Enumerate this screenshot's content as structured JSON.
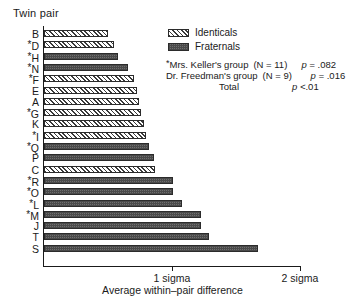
{
  "chart": {
    "y_axis_title": "Twin pair",
    "x_axis_title": "Average within–pair difference",
    "tick_labels": [
      "1 sigma",
      "2 sigma"
    ]
  },
  "legend": {
    "items": [
      {
        "label": "Identicals",
        "pattern": "hatched"
      },
      {
        "label": "Fraternals",
        "pattern": "dotted"
      }
    ]
  },
  "notes": [
    {
      "label": "*Mrs. Keller's group",
      "n": "(N = 11)",
      "p_prefix": "p = ",
      "p_value": ".082"
    },
    {
      "label": "Dr. Freedman's group",
      "n": "(N = 9)",
      "p_prefix": "p = ",
      "p_value": ".016"
    },
    {
      "label": "Total",
      "n": "",
      "p_prefix": "p <",
      "p_value": ".01"
    }
  ],
  "chart_data": {
    "type": "bar",
    "orientation": "horizontal",
    "title": "",
    "xlabel": "Average within–pair difference",
    "ylabel": "Twin pair",
    "xlim": [
      0,
      2
    ],
    "xticks": [
      1,
      2
    ],
    "xticklabels": [
      "1 sigma",
      "2 sigma"
    ],
    "grid": false,
    "legend_position": "upper-right",
    "units": "sigma",
    "starred_note": "* marks Mrs. Keller's group",
    "categories": [
      "B",
      "*D",
      "*H",
      "*N",
      "*F",
      "E",
      "A",
      "*G",
      "K",
      "*I",
      "*Q",
      "P",
      "C",
      "*R",
      "*O",
      "*L",
      "*M",
      "J",
      "T",
      "S"
    ],
    "values": [
      0.5,
      0.55,
      0.58,
      0.66,
      0.7,
      0.73,
      0.74,
      0.76,
      0.78,
      0.8,
      0.82,
      0.86,
      0.87,
      1.01,
      1.01,
      1.08,
      1.23,
      1.23,
      1.29,
      1.67
    ],
    "bars": [
      {
        "label": "B",
        "starred": false,
        "value": 0.5,
        "group": "identicals"
      },
      {
        "label": "D",
        "starred": true,
        "value": 0.55,
        "group": "identicals"
      },
      {
        "label": "H",
        "starred": true,
        "value": 0.58,
        "group": "fraternals"
      },
      {
        "label": "N",
        "starred": true,
        "value": 0.66,
        "group": "fraternals"
      },
      {
        "label": "F",
        "starred": true,
        "value": 0.7,
        "group": "identicals"
      },
      {
        "label": "E",
        "starred": false,
        "value": 0.73,
        "group": "identicals"
      },
      {
        "label": "A",
        "starred": false,
        "value": 0.74,
        "group": "identicals"
      },
      {
        "label": "G",
        "starred": true,
        "value": 0.76,
        "group": "identicals"
      },
      {
        "label": "K",
        "starred": false,
        "value": 0.78,
        "group": "identicals"
      },
      {
        "label": "I",
        "starred": true,
        "value": 0.8,
        "group": "identicals"
      },
      {
        "label": "Q",
        "starred": true,
        "value": 0.82,
        "group": "fraternals"
      },
      {
        "label": "P",
        "starred": false,
        "value": 0.86,
        "group": "fraternals"
      },
      {
        "label": "C",
        "starred": false,
        "value": 0.87,
        "group": "identicals"
      },
      {
        "label": "R",
        "starred": true,
        "value": 1.01,
        "group": "fraternals"
      },
      {
        "label": "O",
        "starred": true,
        "value": 1.01,
        "group": "fraternals"
      },
      {
        "label": "L",
        "starred": true,
        "value": 1.08,
        "group": "fraternals"
      },
      {
        "label": "M",
        "starred": true,
        "value": 1.23,
        "group": "fraternals"
      },
      {
        "label": "J",
        "starred": false,
        "value": 1.23,
        "group": "fraternals"
      },
      {
        "label": "T",
        "starred": false,
        "value": 1.29,
        "group": "fraternals"
      },
      {
        "label": "S",
        "starred": false,
        "value": 1.67,
        "group": "fraternals"
      }
    ]
  }
}
